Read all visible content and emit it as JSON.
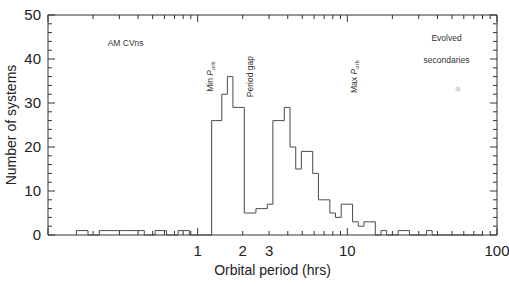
{
  "figure": {
    "background": "#ffffff",
    "line_color": "#4a4a4a",
    "axis_color": "#333333"
  },
  "axes": {
    "x": {
      "label": "Orbital period (hrs)",
      "scale": "log",
      "range": [
        0.1,
        100
      ],
      "major_ticks": [
        1,
        2,
        3,
        10,
        100
      ],
      "tick_labels": [
        "1",
        "2",
        "3",
        "10",
        "100"
      ]
    },
    "y": {
      "label": "Number of systems",
      "scale": "linear",
      "range": [
        0,
        50
      ],
      "major_ticks": [
        0,
        10,
        20,
        30,
        40,
        50
      ],
      "tick_labels": [
        "0",
        "10",
        "20",
        "30",
        "40",
        "50"
      ],
      "minor_tick_step": 2
    }
  },
  "annotations": [
    {
      "name": "am-cvns",
      "text": "AM CVns",
      "x_hrs": 0.33,
      "y_value": 43,
      "rotation": 0
    },
    {
      "name": "min-porb",
      "text": "Min Porb",
      "x_hrs": 1.26,
      "y_value": 36,
      "rotation": -90
    },
    {
      "name": "period-gap",
      "text": "Period gap",
      "x_hrs": 2.35,
      "y_value": 36,
      "rotation": -90
    },
    {
      "name": "max-porb",
      "text": "Max Porb",
      "x_hrs": 11.6,
      "y_value": 36,
      "rotation": -90
    },
    {
      "name": "evolved-secondaries-line1",
      "text": "Evolved",
      "x_hrs": 46,
      "y_value": 44,
      "rotation": 0
    },
    {
      "name": "evolved-secondaries-line2",
      "text": "secondaries",
      "x_hrs": 46,
      "y_value": 39,
      "rotation": 0
    }
  ],
  "chart_data": {
    "type": "bar",
    "title": "",
    "xlabel": "Orbital period (hrs)",
    "ylabel": "Number of systems",
    "xscale": "log",
    "xlim": [
      0.1,
      100
    ],
    "ylim": [
      0,
      50
    ],
    "grid": false,
    "legend": null,
    "bin_edges_hrs": [
      0.155,
      0.185,
      0.22,
      0.26,
      0.31,
      0.37,
      0.44,
      0.52,
      0.62,
      0.74,
      0.88,
      1.05,
      1.24,
      1.32,
      1.45,
      1.58,
      1.72,
      1.88,
      2.05,
      2.24,
      2.45,
      2.67,
      2.92,
      3.18,
      3.47,
      3.79,
      4.14,
      4.52,
      4.93,
      5.38,
      5.87,
      6.41,
      7.0,
      7.64,
      8.34,
      9.1,
      9.93,
      10.84,
      11.83,
      12.91,
      14.09,
      15.38,
      16.79,
      18.32,
      20.0,
      21.83,
      23.82,
      26.0,
      28.38,
      30.97,
      33.8,
      36.89,
      40.26,
      43.94,
      47.96,
      52.35,
      57.13,
      62.35,
      68.05,
      74.27,
      81.06
    ],
    "counts": [
      1,
      0,
      1,
      1,
      1,
      1,
      0,
      1,
      0,
      1,
      0,
      0,
      26,
      26,
      32,
      36,
      29,
      29,
      5,
      5,
      6,
      6,
      7,
      26,
      26,
      29,
      20,
      15,
      19,
      19,
      14,
      8,
      8,
      5,
      4,
      7,
      7,
      3,
      2,
      3,
      3,
      0,
      1,
      0,
      0,
      1,
      1,
      0,
      0,
      0,
      1,
      0,
      0,
      0,
      0,
      0,
      0,
      0,
      0,
      0
    ],
    "categories": [],
    "values": [],
    "peaks": [
      {
        "name": "below-gap-peak",
        "period_hrs": 1.65,
        "count": 36
      },
      {
        "name": "above-gap-peak",
        "period_hrs": 3.3,
        "count": 29
      }
    ],
    "period_gap_hrs": [
      2.05,
      3.18
    ]
  }
}
